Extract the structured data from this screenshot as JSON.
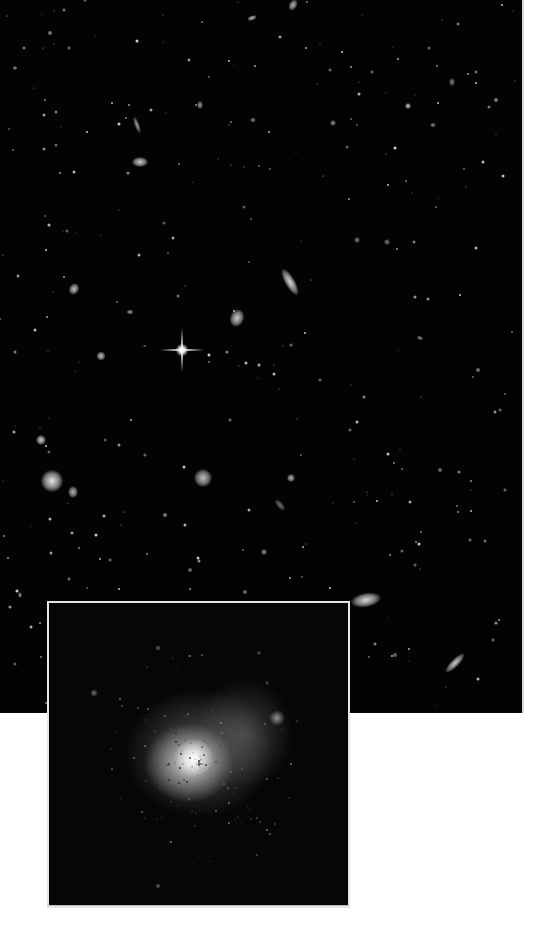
{
  "image": {
    "description": "Deep field of distant galaxies with a magnified inset of a diffuse galaxy",
    "field": {
      "width": 522,
      "height": 713,
      "background": "#030303"
    },
    "inset": {
      "left": 47,
      "top": 601,
      "width": 299,
      "height": 303,
      "border_color": "#e6e6e6"
    },
    "bright_star": {
      "x": 182,
      "y": 350
    },
    "galaxies": [
      {
        "x": 140,
        "y": 162,
        "w": 16,
        "h": 10,
        "rot": 0,
        "b": 0.8
      },
      {
        "x": 137,
        "y": 125,
        "w": 5,
        "h": 18,
        "rot": -20,
        "b": 0.6
      },
      {
        "x": 293,
        "y": 5,
        "w": 8,
        "h": 12,
        "rot": 30,
        "b": 0.7
      },
      {
        "x": 252,
        "y": 18,
        "w": 10,
        "h": 5,
        "rot": -20,
        "b": 0.7
      },
      {
        "x": 290,
        "y": 282,
        "w": 10,
        "h": 30,
        "rot": -30,
        "b": 0.85
      },
      {
        "x": 237,
        "y": 318,
        "w": 14,
        "h": 18,
        "rot": 20,
        "b": 0.8
      },
      {
        "x": 74,
        "y": 289,
        "w": 10,
        "h": 12,
        "rot": 30,
        "b": 0.75
      },
      {
        "x": 101,
        "y": 356,
        "w": 9,
        "h": 9,
        "rot": 0,
        "b": 0.75
      },
      {
        "x": 130,
        "y": 312,
        "w": 7,
        "h": 5,
        "rot": 0,
        "b": 0.6
      },
      {
        "x": 41,
        "y": 440,
        "w": 10,
        "h": 10,
        "rot": 0,
        "b": 0.8
      },
      {
        "x": 52,
        "y": 481,
        "w": 22,
        "h": 22,
        "rot": 0,
        "b": 0.9
      },
      {
        "x": 73,
        "y": 492,
        "w": 10,
        "h": 12,
        "rot": 0,
        "b": 0.7
      },
      {
        "x": 203,
        "y": 478,
        "w": 18,
        "h": 18,
        "rot": 0,
        "b": 0.75
      },
      {
        "x": 291,
        "y": 478,
        "w": 8,
        "h": 8,
        "rot": 0,
        "b": 0.7
      },
      {
        "x": 280,
        "y": 505,
        "w": 6,
        "h": 14,
        "rot": -40,
        "b": 0.45
      },
      {
        "x": 264,
        "y": 552,
        "w": 6,
        "h": 6,
        "rot": 0,
        "b": 0.6
      },
      {
        "x": 366,
        "y": 600,
        "w": 30,
        "h": 14,
        "rot": -10,
        "b": 0.85
      },
      {
        "x": 455,
        "y": 663,
        "w": 8,
        "h": 26,
        "rot": 45,
        "b": 0.8
      },
      {
        "x": 408,
        "y": 106,
        "w": 6,
        "h": 6,
        "rot": 0,
        "b": 0.8
      },
      {
        "x": 333,
        "y": 123,
        "w": 6,
        "h": 6,
        "rot": 0,
        "b": 0.55
      },
      {
        "x": 452,
        "y": 82,
        "w": 6,
        "h": 8,
        "rot": 0,
        "b": 0.5
      },
      {
        "x": 496,
        "y": 100,
        "w": 5,
        "h": 5,
        "rot": 0,
        "b": 0.6
      },
      {
        "x": 200,
        "y": 105,
        "w": 6,
        "h": 8,
        "rot": 0,
        "b": 0.6
      },
      {
        "x": 420,
        "y": 338,
        "w": 7,
        "h": 4,
        "rot": 20,
        "b": 0.55
      },
      {
        "x": 387,
        "y": 242,
        "w": 6,
        "h": 6,
        "rot": 0,
        "b": 0.5
      },
      {
        "x": 357,
        "y": 240,
        "w": 6,
        "h": 6,
        "rot": 0,
        "b": 0.5
      },
      {
        "x": 478,
        "y": 370,
        "w": 5,
        "h": 5,
        "rot": 0,
        "b": 0.55
      },
      {
        "x": 500,
        "y": 410,
        "w": 4,
        "h": 4,
        "rot": 0,
        "b": 0.5
      },
      {
        "x": 440,
        "y": 470,
        "w": 5,
        "h": 5,
        "rot": 0,
        "b": 0.5
      },
      {
        "x": 165,
        "y": 515,
        "w": 5,
        "h": 5,
        "rot": 0,
        "b": 0.6
      },
      {
        "x": 190,
        "y": 570,
        "w": 5,
        "h": 5,
        "rot": 0,
        "b": 0.5
      },
      {
        "x": 20,
        "y": 595,
        "w": 4,
        "h": 6,
        "rot": 0,
        "b": 0.6
      },
      {
        "x": 395,
        "y": 655,
        "w": 5,
        "h": 5,
        "rot": 0,
        "b": 0.5
      },
      {
        "x": 493,
        "y": 640,
        "w": 4,
        "h": 4,
        "rot": 0,
        "b": 0.5
      },
      {
        "x": 15,
        "y": 68,
        "w": 5,
        "h": 4,
        "rot": 0,
        "b": 0.6
      },
      {
        "x": 50,
        "y": 33,
        "w": 5,
        "h": 5,
        "rot": 0,
        "b": 0.6
      },
      {
        "x": 24,
        "y": 48,
        "w": 4,
        "h": 4,
        "rot": 0,
        "b": 0.6
      },
      {
        "x": 69,
        "y": 48,
        "w": 4,
        "h": 4,
        "rot": 0,
        "b": 0.5
      },
      {
        "x": 458,
        "y": 24,
        "w": 4,
        "h": 4,
        "rot": 0,
        "b": 0.6
      },
      {
        "x": 476,
        "y": 72,
        "w": 4,
        "h": 4,
        "rot": 0,
        "b": 0.55
      },
      {
        "x": 330,
        "y": 70,
        "w": 4,
        "h": 4,
        "rot": 0,
        "b": 0.5
      },
      {
        "x": 372,
        "y": 72,
        "w": 4,
        "h": 4,
        "rot": 0,
        "b": 0.5
      },
      {
        "x": 253,
        "y": 120,
        "w": 6,
        "h": 5,
        "rot": 0,
        "b": 0.5
      },
      {
        "x": 433,
        "y": 125,
        "w": 6,
        "h": 5,
        "rot": 0,
        "b": 0.5
      },
      {
        "x": 320,
        "y": 380,
        "w": 4,
        "h": 4,
        "rot": 0,
        "b": 0.5
      },
      {
        "x": 350,
        "y": 430,
        "w": 4,
        "h": 4,
        "rot": 0,
        "b": 0.5
      },
      {
        "x": 230,
        "y": 420,
        "w": 4,
        "h": 4,
        "rot": 0,
        "b": 0.5
      },
      {
        "x": 145,
        "y": 455,
        "w": 4,
        "h": 4,
        "rot": 0,
        "b": 0.5
      },
      {
        "x": 110,
        "y": 560,
        "w": 4,
        "h": 4,
        "rot": 0,
        "b": 0.5
      },
      {
        "x": 245,
        "y": 592,
        "w": 5,
        "h": 5,
        "rot": 0,
        "b": 0.5
      },
      {
        "x": 415,
        "y": 565,
        "w": 4,
        "h": 4,
        "rot": 0,
        "b": 0.5
      },
      {
        "x": 470,
        "y": 540,
        "w": 4,
        "h": 4,
        "rot": 0,
        "b": 0.5
      },
      {
        "x": 505,
        "y": 490,
        "w": 4,
        "h": 4,
        "rot": 0,
        "b": 0.5
      }
    ],
    "inset_blobs": [
      {
        "x": 150,
        "y": 150,
        "w": 150,
        "h": 130,
        "color": "rgba(150,150,150,0.55)"
      },
      {
        "x": 195,
        "y": 130,
        "w": 100,
        "h": 110,
        "color": "rgba(120,120,120,0.5)"
      },
      {
        "x": 140,
        "y": 160,
        "w": 90,
        "h": 80,
        "color": "rgba(230,230,230,0.85)"
      },
      {
        "x": 145,
        "y": 155,
        "w": 40,
        "h": 40,
        "color": "rgba(255,255,255,1)"
      },
      {
        "x": 228,
        "y": 115,
        "w": 16,
        "h": 16,
        "color": "rgba(200,200,200,0.7)"
      },
      {
        "x": 45,
        "y": 90,
        "w": 8,
        "h": 8,
        "color": "rgba(170,170,170,0.7)"
      },
      {
        "x": 109,
        "y": 45,
        "w": 6,
        "h": 6,
        "color": "rgba(170,170,170,0.6)"
      },
      {
        "x": 210,
        "y": 50,
        "w": 5,
        "h": 5,
        "color": "rgba(170,170,170,0.5)"
      },
      {
        "x": 109,
        "y": 283,
        "w": 6,
        "h": 6,
        "color": "rgba(170,170,170,0.6)"
      },
      {
        "x": 218,
        "y": 80,
        "w": 5,
        "h": 5,
        "color": "rgba(150,150,150,0.5)"
      }
    ]
  }
}
